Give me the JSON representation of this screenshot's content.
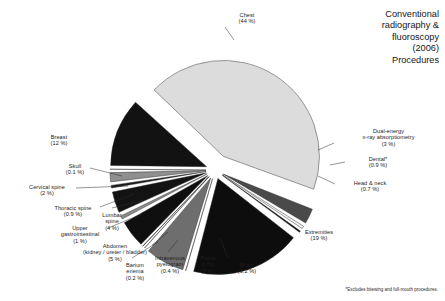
{
  "chart_title": "Conventional\nradiography &\nfluoroscopy\n(2006)\nProcedures",
  "footnote": "*Excludes bitewing and full-mouth procedures.",
  "chart_data": {
    "type": "pie",
    "title": "Conventional radiography & fluoroscopy (2006) Procedures",
    "subtitle": "",
    "xlabel": "",
    "ylabel": "",
    "legend_position": "none",
    "grid": false,
    "note": "*Excludes bitewing and full-mouth procedures.",
    "units": "percent of procedures",
    "exploded": true,
    "categories": [
      "Chest",
      "Dual-energy x-ray absorptiometry",
      "Dental*",
      "Head & neck",
      "Extremities",
      "Biliary",
      "Pelvis & hip",
      "Intravenous pyelogram",
      "Barium enema",
      "Abdomen (kidney / ureter / bladder)",
      "Upper gastrointestinal",
      "Lumbar spine",
      "Thoracic spine",
      "Cervical spine",
      "Skull",
      "Breast"
    ],
    "values": [
      44,
      3,
      0.9,
      0.7,
      19,
      0.2,
      7,
      0.4,
      0.2,
      5,
      1,
      4,
      0.9,
      2,
      0.1,
      12
    ],
    "value_labels": [
      "(44 %)",
      "(3 %)",
      "(0.9 %)",
      "(0.7 %)",
      "(19 %)",
      "(0.2 %)",
      "(7 %)",
      "(0.4 %)",
      "(0.2 %)",
      "(5 %)",
      "(1 %)",
      "(4 %)",
      "(0.9 %)",
      "(2 %)",
      "(0.1 %)",
      "(12 %)"
    ],
    "colors": [
      "#dcdcdc",
      "#4a4a4a",
      "#f2f2f2",
      "#111111",
      "#0d0d0d",
      "#f4f4f4",
      "#6e6e6e",
      "#ececec",
      "#111111",
      "#0f0f0f",
      "#8c8c8c",
      "#131313",
      "#1a1a1a",
      "#8f8f8f",
      "#f0f0f0",
      "#121212"
    ]
  },
  "slice_labels": [
    {
      "name": "chest",
      "line1": "Chest",
      "line2": "(44 %)",
      "x": 212,
      "y": 12,
      "w": 70,
      "align": "c"
    },
    {
      "name": "dxa",
      "line1": "Dual-energy\nx-ray absorptiometry",
      "line2": "(3 %)",
      "x": 336,
      "y": 128,
      "w": 105,
      "align": "c"
    },
    {
      "name": "dental",
      "line1": "Dental*",
      "line2": "(0.9 %)",
      "x": 348,
      "y": 156,
      "w": 60,
      "align": "c"
    },
    {
      "name": "head-neck",
      "line1": "Head & neck",
      "line2": "(0.7 %)",
      "x": 337,
      "y": 180,
      "w": 66,
      "align": "c"
    },
    {
      "name": "extremities",
      "line1": "Extremities",
      "line2": "(19 %)",
      "x": 286,
      "y": 229,
      "w": 66,
      "align": "c"
    },
    {
      "name": "biliary",
      "line1": "Biliary",
      "line2": "(0.2 %)",
      "x": 226,
      "y": 262,
      "w": 42,
      "align": "c"
    },
    {
      "name": "pelvis-hip",
      "line1": "Pelvis\n& hip",
      "line2": "(7 %)",
      "x": 190,
      "y": 255,
      "w": 36,
      "align": "c"
    },
    {
      "name": "iv-pyelogram",
      "line1": "Intravenous\npyelogram",
      "line2": "(0.4 %)",
      "x": 148,
      "y": 255,
      "w": 44,
      "align": "c"
    },
    {
      "name": "barium-enema",
      "line1": "Barium\nenema",
      "line2": "(0.2 %)",
      "x": 118,
      "y": 262,
      "w": 34,
      "align": "c"
    },
    {
      "name": "abdomen",
      "line1": "Abdomen\n(kidney / ureter / bladder)",
      "line2": "(5 %)",
      "x": 74,
      "y": 243,
      "w": 82,
      "align": "c"
    },
    {
      "name": "upper-gi",
      "line1": "Upper\ngastrointestinal",
      "line2": "(1 %)",
      "x": 52,
      "y": 225,
      "w": 56,
      "align": "c"
    },
    {
      "name": "lumbar-spine",
      "line1": "Lumbar\nspine",
      "line2": "(4 %)",
      "x": 95,
      "y": 212,
      "w": 34,
      "align": "c"
    },
    {
      "name": "thoracic-spine",
      "line1": "Thoracic spine",
      "line2": "(0.9 %)",
      "x": 44,
      "y": 205,
      "w": 58,
      "align": "c"
    },
    {
      "name": "cervical-spine",
      "line1": "Cervical spine",
      "line2": "(2 %)",
      "x": 18,
      "y": 184,
      "w": 58,
      "align": "c"
    },
    {
      "name": "skull",
      "line1": "Skull",
      "line2": "(0.1 %)",
      "x": 58,
      "y": 163,
      "w": 34,
      "align": "c"
    },
    {
      "name": "breast",
      "line1": "Breast",
      "line2": "(12 %)",
      "x": 40,
      "y": 134,
      "w": 38,
      "align": "c"
    }
  ],
  "leaders": [
    {
      "name": "leader-chest",
      "d": "M 225 27 L 234 40"
    },
    {
      "name": "leader-dxa",
      "d": "M 334 143 L 318 150"
    },
    {
      "name": "leader-dental",
      "d": "M 345 162 L 330 165"
    },
    {
      "name": "leader-head-neck",
      "d": "M 335 184 L 318 176"
    },
    {
      "name": "leader-skull",
      "d": "M 90 168 L 122 176"
    },
    {
      "name": "leader-cervical",
      "d": "M 76 188 L 128 186"
    },
    {
      "name": "leader-thoracic",
      "d": "M 100 207 L 134 194"
    },
    {
      "name": "leader-upper-gi",
      "d": "M 108 228 L 142 214"
    },
    {
      "name": "leader-abdomen",
      "d": "M 152 245 L 168 232"
    },
    {
      "name": "leader-barium",
      "d": "M 132 258 L 158 242"
    },
    {
      "name": "leader-ivp",
      "d": "M 168 252 L 178 240"
    },
    {
      "name": "leader-biliary",
      "d": "M 228 258 L 220 238"
    },
    {
      "name": "leader-lumbar",
      "d": "M 112 208 L 144 200"
    }
  ]
}
